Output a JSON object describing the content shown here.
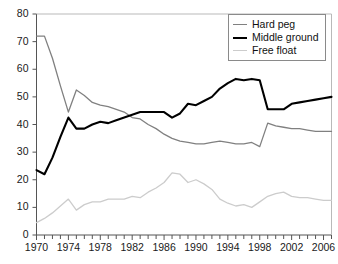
{
  "chart_data": {
    "type": "line",
    "title": "",
    "subtitle": "",
    "xlabel": "",
    "ylabel": "",
    "xlim": [
      1970,
      2007
    ],
    "ylim": [
      0,
      80
    ],
    "yticks": [
      0,
      10,
      20,
      30,
      40,
      50,
      60,
      70,
      80
    ],
    "xticks": [
      1970,
      1971,
      1972,
      1973,
      1974,
      1975,
      1976,
      1977,
      1978,
      1979,
      1980,
      1981,
      1982,
      1983,
      1984,
      1985,
      1986,
      1987,
      1988,
      1989,
      1990,
      1991,
      1992,
      1993,
      1994,
      1995,
      1996,
      1997,
      1998,
      1999,
      2000,
      2001,
      2002,
      2003,
      2004,
      2005,
      2006,
      2007
    ],
    "xtick_labels": [
      "1970",
      "1974",
      "1978",
      "1982",
      "1986",
      "1990",
      "1994",
      "1998",
      "2002",
      "2006"
    ],
    "xtick_label_years": [
      1970,
      1974,
      1978,
      1982,
      1986,
      1990,
      1994,
      1998,
      2002,
      2006
    ],
    "grid": false,
    "legend_position": "top-right",
    "x": [
      1970,
      1971,
      1972,
      1973,
      1974,
      1975,
      1976,
      1977,
      1978,
      1979,
      1980,
      1981,
      1982,
      1983,
      1984,
      1985,
      1986,
      1987,
      1988,
      1989,
      1990,
      1991,
      1992,
      1993,
      1994,
      1995,
      1996,
      1997,
      1998,
      1999,
      2000,
      2001,
      2002,
      2003,
      2004,
      2005,
      2006,
      2007
    ],
    "series": [
      {
        "name": "Hard peg",
        "color": "#808080",
        "width": 1.3,
        "values": [
          72.0,
          72.0,
          64.0,
          54.0,
          44.5,
          52.5,
          50.5,
          48.0,
          47.0,
          46.5,
          45.5,
          44.5,
          42.5,
          42.0,
          40.0,
          38.5,
          36.5,
          35.0,
          34.0,
          33.5,
          33.0,
          33.0,
          33.5,
          34.0,
          33.5,
          33.0,
          33.0,
          33.5,
          32.0,
          40.5,
          39.5,
          39.0,
          38.5,
          38.5,
          38.0,
          37.5,
          37.5,
          37.5
        ]
      },
      {
        "name": "Middle ground",
        "color": "#000000",
        "width": 2.1,
        "values": [
          23.5,
          22.0,
          28.0,
          35.5,
          42.5,
          38.5,
          38.5,
          40.0,
          41.0,
          40.5,
          41.5,
          42.5,
          43.5,
          44.5,
          44.5,
          44.5,
          44.5,
          42.5,
          44.0,
          47.5,
          47.0,
          48.5,
          50.0,
          53.0,
          55.0,
          56.5,
          56.0,
          56.5,
          56.0,
          45.5,
          45.5,
          45.5,
          47.5,
          48.0,
          48.5,
          49.0,
          49.5,
          50.0
        ]
      },
      {
        "name": "Free float",
        "color": "#cccccc",
        "width": 1.3,
        "values": [
          4.5,
          6.0,
          8.0,
          10.5,
          13.0,
          9.0,
          11.0,
          12.0,
          12.0,
          13.0,
          13.0,
          13.0,
          14.0,
          13.5,
          15.5,
          17.0,
          19.0,
          22.5,
          22.0,
          19.0,
          20.0,
          18.5,
          16.5,
          13.0,
          11.5,
          10.5,
          11.0,
          10.0,
          12.0,
          14.0,
          15.0,
          15.5,
          14.0,
          13.5,
          13.5,
          13.0,
          12.5,
          12.5
        ]
      }
    ]
  },
  "legend": {
    "items": [
      {
        "label": "Hard peg"
      },
      {
        "label": "Middle ground"
      },
      {
        "label": "Free float"
      }
    ]
  },
  "axes": {
    "y_labels": [
      "80",
      "70",
      "60",
      "50",
      "40",
      "30",
      "20",
      "10",
      "0"
    ],
    "x_labels": [
      "1970",
      "1974",
      "1978",
      "1982",
      "1986",
      "1990",
      "1994",
      "1998",
      "2002",
      "2006"
    ]
  }
}
